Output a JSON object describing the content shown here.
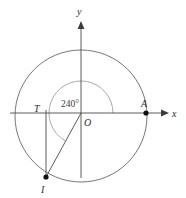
{
  "figure": {
    "canvas": {
      "width": 186,
      "height": 198,
      "background": "#ffffff"
    },
    "axes": {
      "x_label": "x",
      "y_label": "y",
      "origin_label": "O",
      "x_axis": {
        "y": 113,
        "x_start": 10,
        "x_end": 168,
        "arrow": true
      },
      "y_axis": {
        "x": 81,
        "y_start": 178,
        "y_end": 22,
        "arrow": true
      },
      "color": "#4a4a4a"
    },
    "circle": {
      "center_x": 81,
      "center_y": 116,
      "radius": 66,
      "color": "#666666"
    },
    "angle": {
      "value_label": "240°",
      "degrees": 240,
      "arc_radius": 32,
      "arc_color": "#9a9a9a",
      "label_x": 72,
      "label_y": 103
    },
    "points": [
      {
        "id": "A",
        "label": "A",
        "x": 146,
        "y": 113,
        "filled": true,
        "label_x": 142,
        "label_y": 107
      },
      {
        "id": "T",
        "label": "T",
        "x": 46,
        "y": 113,
        "filled": false,
        "label_x": 36,
        "label_y": 111
      },
      {
        "id": "I",
        "label": "I",
        "x": 46,
        "y": 177,
        "filled": true,
        "label_x": 41,
        "label_y": 192
      }
    ],
    "segments": [
      {
        "id": "terminal-radius",
        "from": "O",
        "to": "I",
        "x1": 81,
        "y1": 113,
        "x2": 46,
        "y2": 177
      },
      {
        "id": "vertical-drop",
        "from": "T",
        "to": "I",
        "x1": 46,
        "y1": 110,
        "x2": 46,
        "y2": 177
      }
    ]
  }
}
